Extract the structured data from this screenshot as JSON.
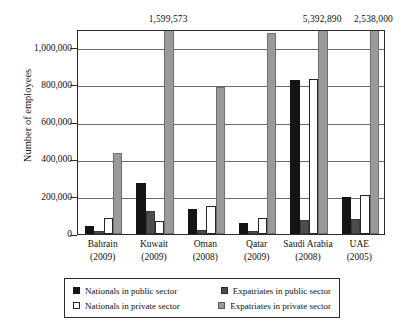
{
  "chart_data": {
    "type": "bar",
    "title": "",
    "xlabel": "",
    "ylabel": "Number of employees",
    "ylim": [
      0,
      1100000
    ],
    "y_ticks": [
      "0",
      "200,000",
      "400,000",
      "600,000",
      "800,000",
      "1,000,000"
    ],
    "y_tick_values": [
      0,
      200000,
      400000,
      600000,
      800000,
      1000000
    ],
    "grid": true,
    "legend_position": "bottom",
    "categories": [
      "Bahrain",
      "Kuwait",
      "Oman",
      "Qatar",
      "Saudi Arabia",
      "UAE"
    ],
    "category_years": [
      "(2009)",
      "(2009)",
      "(2008)",
      "(2009)",
      "(2008)",
      "(2005)"
    ],
    "tick_labels": [
      "Bahrain\n(2009)",
      "Kuwait\n(2009)",
      "Oman\n(2008)",
      "Qatar\n(2009)",
      "Saudi Arabia\n(2008)",
      "UAE\n(2005)"
    ],
    "series": [
      {
        "name": "Nationals in public sector",
        "color": "#141414",
        "values": [
          45000,
          275000,
          135000,
          60000,
          825000,
          197000
        ]
      },
      {
        "name": "Expatriates in public sector",
        "color": "#4d4d4d",
        "values": [
          15000,
          122000,
          20000,
          18000,
          75000,
          80000
        ]
      },
      {
        "name": "Nationals in private sector",
        "color": "#ffffff",
        "values": [
          86000,
          68000,
          150000,
          86000,
          830000,
          208000
        ]
      },
      {
        "name": "Expatriates in private sector",
        "color": "#9a9a9a",
        "values": [
          437000,
          1599573,
          790000,
          1080000,
          5392890,
          2538000
        ]
      }
    ],
    "annotations": [
      {
        "label": "1,599,573",
        "category": "Kuwait",
        "series": "Expatriates in private sector"
      },
      {
        "label": "5,392,890",
        "category": "Saudi Arabia",
        "series": "Expatriates in private sector"
      },
      {
        "label": "2,538,000",
        "category": "UAE",
        "series": "Expatriates in private sector"
      }
    ]
  },
  "legend": {
    "items": [
      {
        "label": "Nationals in public sector",
        "swatch": "black-square-icon"
      },
      {
        "label": "Expatriates in public sector",
        "swatch": "dark-gray-square-icon"
      },
      {
        "label": "Nationals in private sector",
        "swatch": "white-square-icon"
      },
      {
        "label": "Expatriates in private sector",
        "swatch": "light-gray-square-icon"
      }
    ]
  }
}
